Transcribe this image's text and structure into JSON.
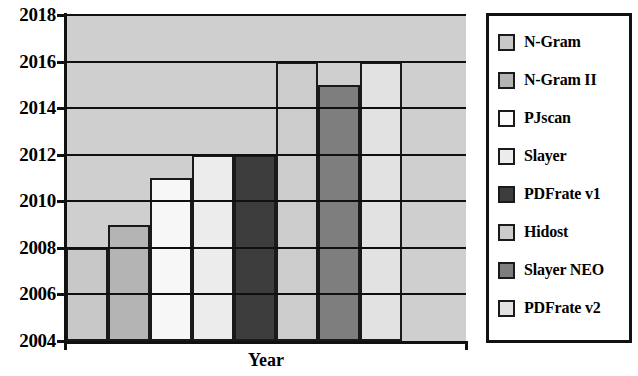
{
  "chart_data": {
    "type": "bar",
    "title": "",
    "xlabel": "Year",
    "ylabel": "",
    "ylim": [
      2004,
      2018
    ],
    "yticks": [
      2004,
      2006,
      2008,
      2010,
      2012,
      2014,
      2016,
      2018
    ],
    "grid": true,
    "legend_position": "right",
    "categories": [
      "N-Gram",
      "N-Gram II",
      "PJscan",
      "Slayer",
      "PDFrate v1",
      "Hidost",
      "Slayer NEO",
      "PDFrate v2"
    ],
    "values": [
      2008,
      2009,
      2011,
      2012,
      2012,
      2016,
      2015,
      2016
    ],
    "bar_colors": [
      "#c8c8c8",
      "#b4b4b4",
      "#f7f7f7",
      "#ececec",
      "#3d3d3d",
      "#cccccc",
      "#7e7e7e",
      "#e2e2e2"
    ],
    "series": [
      {
        "name": "N-Gram",
        "value": 2008,
        "color": "#c8c8c8"
      },
      {
        "name": "N-Gram II",
        "value": 2009,
        "color": "#b4b4b4"
      },
      {
        "name": "PJscan",
        "value": 2011,
        "color": "#f7f7f7"
      },
      {
        "name": "Slayer",
        "value": 2012,
        "color": "#ececec"
      },
      {
        "name": "PDFrate v1",
        "value": 2012,
        "color": "#3d3d3d"
      },
      {
        "name": "Hidost",
        "value": 2016,
        "color": "#cccccc"
      },
      {
        "name": "Slayer NEO",
        "value": 2015,
        "color": "#7e7e7e"
      },
      {
        "name": "PDFrate v2",
        "value": 2016,
        "color": "#e2e2e2"
      }
    ]
  },
  "axis": {
    "x_title": "Year",
    "y_tick_labels": [
      "2018",
      "2016",
      "2014",
      "2012",
      "2010",
      "2008",
      "2006",
      "2004"
    ]
  },
  "legend": {
    "items": [
      {
        "label": "N-Gram",
        "color": "#c8c8c8"
      },
      {
        "label": "N-Gram II",
        "color": "#b4b4b4"
      },
      {
        "label": "PJscan",
        "color": "#fbfbfb"
      },
      {
        "label": "Slayer",
        "color": "#ececec"
      },
      {
        "label": "PDFrate v1",
        "color": "#3d3d3d"
      },
      {
        "label": "Hidost",
        "color": "#cccccc"
      },
      {
        "label": "Slayer NEO",
        "color": "#7e7e7e"
      },
      {
        "label": "PDFrate v2",
        "color": "#e2e2e2"
      }
    ]
  },
  "style": {
    "plot_background": "#cfcfcf",
    "axis_color": "#111111",
    "grid_color": "#101010",
    "legend_border": "#111111"
  }
}
